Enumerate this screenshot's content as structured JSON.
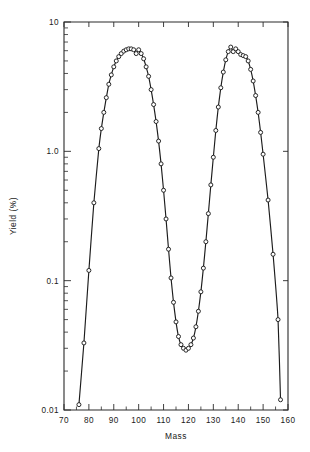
{
  "chart_data": {
    "type": "line",
    "title": "",
    "subtitle": "",
    "xlabel": "Mass",
    "ylabel": "Yield (%)",
    "yscale": "log",
    "xscale": "linear",
    "xlim": [
      70,
      160
    ],
    "ylim": [
      0.01,
      10
    ],
    "grid": false,
    "legend": null,
    "legend_position": "none",
    "xticks": [
      70,
      80,
      90,
      100,
      110,
      120,
      130,
      140,
      150,
      160
    ],
    "xtick_labels": [
      "70",
      "80",
      "90",
      "100",
      "110",
      "120",
      "130",
      "140",
      "150",
      "160"
    ],
    "xminor_step": 5,
    "yticks": [
      0.01,
      0.1,
      1.0,
      10
    ],
    "ytick_labels": [
      "0.01",
      "0.1",
      "1.0",
      "10"
    ],
    "marker_style": "open-circle",
    "series": [
      {
        "name": "Fission product mass yield",
        "x": [
          76,
          78,
          80,
          82,
          84,
          85,
          86,
          87,
          88,
          89,
          90,
          91,
          92,
          93,
          94,
          95,
          96,
          97,
          98,
          99,
          100,
          101,
          102,
          103,
          104,
          105,
          106,
          107,
          108,
          109,
          110,
          111,
          112,
          113,
          114,
          115,
          116,
          117,
          118,
          119,
          120,
          121,
          122,
          123,
          124,
          125,
          126,
          127,
          128,
          129,
          130,
          131,
          132,
          133,
          134,
          135,
          136,
          137,
          138,
          139,
          140,
          141,
          142,
          143,
          144,
          145,
          146,
          147,
          148,
          149,
          150,
          152,
          154,
          156,
          157
        ],
        "y": [
          0.011,
          0.033,
          0.12,
          0.4,
          1.05,
          1.5,
          2.0,
          2.6,
          3.3,
          3.9,
          4.5,
          5.0,
          5.4,
          5.7,
          5.95,
          6.1,
          6.2,
          6.2,
          6.1,
          5.7,
          6.1,
          5.7,
          5.2,
          4.5,
          3.8,
          3.0,
          2.3,
          1.7,
          1.2,
          0.8,
          0.5,
          0.3,
          0.175,
          0.105,
          0.068,
          0.048,
          0.037,
          0.032,
          0.03,
          0.029,
          0.03,
          0.032,
          0.036,
          0.044,
          0.058,
          0.082,
          0.125,
          0.2,
          0.33,
          0.55,
          0.9,
          1.45,
          2.2,
          3.1,
          4.1,
          5.1,
          5.9,
          6.4,
          5.9,
          6.2,
          5.9,
          5.6,
          5.5,
          5.4,
          5.0,
          4.3,
          3.5,
          2.7,
          2.0,
          1.4,
          0.95,
          0.42,
          0.16,
          0.05,
          0.012
        ]
      }
    ]
  }
}
